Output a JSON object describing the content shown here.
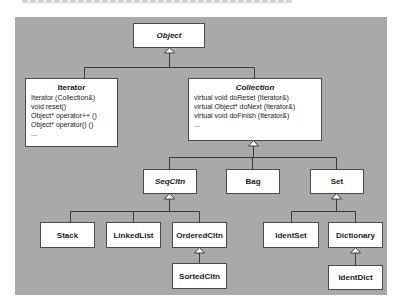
{
  "diagram": {
    "type": "class-hierarchy",
    "classes": {
      "object": {
        "name": "Object",
        "abstract": true
      },
      "iterator": {
        "name": "Iterator",
        "abstract": false,
        "members": [
          "Iterator (Collection&)",
          "void reset()",
          "Object* operator++ ()",
          "Object* operator() ()",
          "..."
        ]
      },
      "collection": {
        "name": "Collection",
        "abstract": true,
        "members": [
          "virtual void doReset (Iterator&)",
          "virtual Object* doNext (Iterator&)",
          "virtual void doFinish (Iterator&)",
          "..."
        ]
      },
      "seqcltn": {
        "name": "SeqCltn",
        "abstract": true
      },
      "bag": {
        "name": "Bag",
        "abstract": false
      },
      "set": {
        "name": "Set",
        "abstract": false
      },
      "stack": {
        "name": "Stack",
        "abstract": false
      },
      "linkedlist": {
        "name": "LinkedList",
        "abstract": false
      },
      "orderedcltn": {
        "name": "OrderedCltn",
        "abstract": false
      },
      "sortedcltn": {
        "name": "SortedCltn",
        "abstract": false
      },
      "identset": {
        "name": "IdentSet",
        "abstract": false
      },
      "dictionary": {
        "name": "Dictionary",
        "abstract": false
      },
      "identdict": {
        "name": "IdentDict",
        "abstract": false
      }
    },
    "inheritance": [
      {
        "parent": "Object",
        "children": [
          "Iterator",
          "Collection"
        ]
      },
      {
        "parent": "Collection",
        "children": [
          "SeqCltn",
          "Bag",
          "Set"
        ]
      },
      {
        "parent": "SeqCltn",
        "children": [
          "Stack",
          "LinkedList",
          "OrderedCltn"
        ]
      },
      {
        "parent": "OrderedCltn",
        "children": [
          "SortedCltn"
        ]
      },
      {
        "parent": "Set",
        "children": [
          "IdentSet",
          "Dictionary"
        ]
      },
      {
        "parent": "Dictionary",
        "children": [
          "IdentDict"
        ]
      }
    ],
    "colors": {
      "background": "#a9a9a9",
      "box_fill": "#ffffff",
      "line": "#3a3a3a"
    }
  }
}
